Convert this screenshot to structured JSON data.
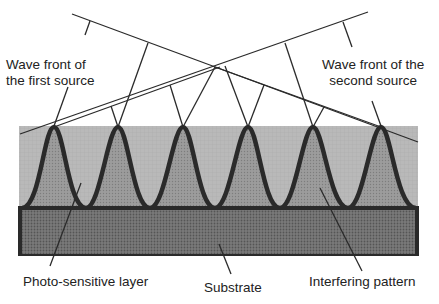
{
  "diagram": {
    "labels": {
      "first_source": [
        "Wave front of",
        "the first source"
      ],
      "second_source": [
        "Wave front of the",
        "second source"
      ],
      "photo_layer": "Photo-sensitive layer",
      "substrate": "Substrate",
      "interfering": "Interfering pattern"
    },
    "peaks_x": [
      54,
      118,
      183,
      248,
      313,
      381
    ],
    "colors": {
      "layer": "#b4b4b4",
      "peak_fill": "#9a9a9a",
      "substrate": "#6e6e6e",
      "line": "#222222"
    }
  }
}
